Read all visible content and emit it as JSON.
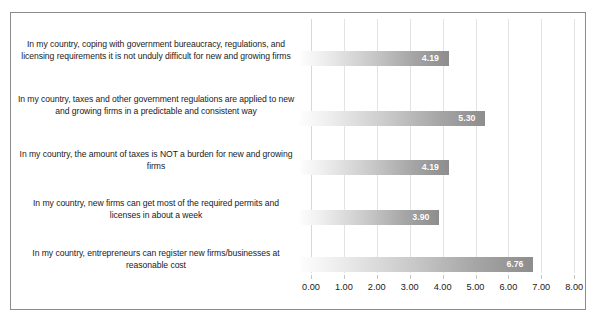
{
  "chart_data": {
    "type": "bar",
    "orientation": "horizontal",
    "title": "",
    "xlabel": "",
    "ylabel": "",
    "xlim": [
      0.0,
      8.0
    ],
    "grid": true,
    "legend": false,
    "categories": [
      "In my country, coping with government bureaucracy, regulations, and licensing requirements it is not unduly difficult for new and growing firms",
      "In my country, taxes and other government regulations are applied to new and growing firms in a predictable and consistent way",
      "In my country, the amount of taxes is NOT a burden for new and growing firms",
      "In my country, new firms can get most of the required permits and licenses in about a week",
      "In my country, entrepreneurs can register new firms/businesses at reasonable cost"
    ],
    "values": [
      4.19,
      5.3,
      4.19,
      3.9,
      6.76
    ],
    "value_labels": [
      "4.19",
      "5.30",
      "4.19",
      "3.90",
      "6.76"
    ],
    "xticks": [
      0.0,
      1.0,
      2.0,
      3.0,
      4.0,
      5.0,
      6.0,
      7.0,
      8.0
    ],
    "xtick_labels": [
      "0.00",
      "1.00",
      "2.00",
      "3.00",
      "4.00",
      "5.00",
      "6.00",
      "7.00",
      "8.00"
    ],
    "colors": {
      "bar_gradient_start": "#fdfdfd",
      "bar_gradient_end": "#8d8d8d",
      "value_label": "#ffffff",
      "gridline": "#e3e3e3",
      "frame_border": "#8c8c8c",
      "text": "#1a1a1a",
      "background": "#ffffff"
    }
  }
}
